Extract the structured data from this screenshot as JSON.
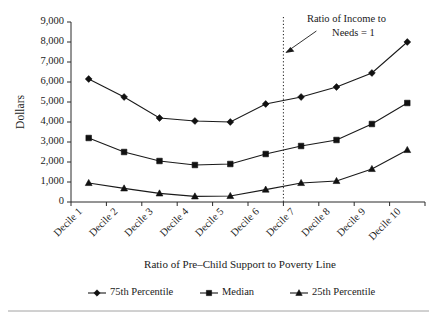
{
  "chart_data": {
    "type": "line",
    "title": "",
    "xlabel": "Ratio of Pre–Child Support to Poverty Line",
    "ylabel": "Dollars",
    "categories": [
      "Decile 1",
      "Decile 2",
      "Decile 3",
      "Decile 4",
      "Decile 5",
      "Decile 6",
      "Decile 7",
      "Decile 8",
      "Decile 9",
      "Decile 10"
    ],
    "ylim": [
      0,
      9000
    ],
    "ytick_labels": [
      "0",
      "1,000",
      "2,000",
      "3,000",
      "4,000",
      "5,000",
      "6,000",
      "7,000",
      "8,000",
      "9,000"
    ],
    "ytick_values": [
      0,
      1000,
      2000,
      3000,
      4000,
      5000,
      6000,
      7000,
      8000,
      9000
    ],
    "grid": false,
    "legend_position": "bottom",
    "series": [
      {
        "name": "75th Percentile",
        "marker": "diamond",
        "values": [
          6150,
          5250,
          4200,
          4050,
          4000,
          4900,
          5250,
          5750,
          6450,
          8000
        ]
      },
      {
        "name": "Median",
        "marker": "square",
        "values": [
          3200,
          2500,
          2050,
          1850,
          1900,
          2400,
          2800,
          3100,
          3900,
          4950
        ]
      },
      {
        "name": "25th Percentile",
        "marker": "triangle",
        "values": [
          950,
          680,
          430,
          280,
          300,
          620,
          950,
          1050,
          1650,
          2600
        ]
      }
    ],
    "annotations": [
      {
        "text_line1": "Ratio of Income to",
        "text_line2": "Needs = 1",
        "target_category_boundary": 6
      }
    ]
  },
  "legend": {
    "items": [
      {
        "label": "75th Percentile",
        "marker": "diamond"
      },
      {
        "label": "Median",
        "marker": "square"
      },
      {
        "label": "25th Percentile",
        "marker": "triangle"
      }
    ]
  }
}
